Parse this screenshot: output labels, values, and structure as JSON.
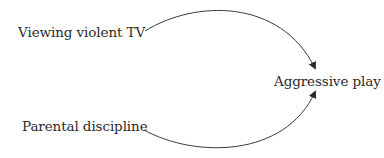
{
  "diagram": {
    "type": "path-diagram",
    "nodes": [
      {
        "id": "tv",
        "label": "Viewing violent TV"
      },
      {
        "id": "discipline",
        "label": "Parental discipline"
      },
      {
        "id": "aggression",
        "label": "Aggressive play"
      }
    ],
    "edges": [
      {
        "from": "tv",
        "to": "aggression",
        "style": "curved-arrow"
      },
      {
        "from": "discipline",
        "to": "aggression",
        "style": "curved-arrow"
      }
    ],
    "line_color": "#3a3a3a"
  }
}
